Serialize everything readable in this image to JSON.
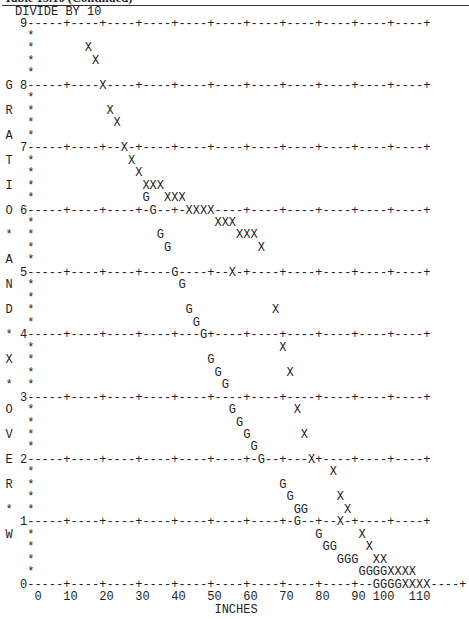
{
  "caption": "Table 15.10 (Continued)",
  "header": "DIVIDE BY 10",
  "chart_data": {
    "type": "scatter",
    "title": "DIVIDE BY 10",
    "xlabel": "INCHES",
    "ylabel": "GRATIO * AND * X * OVER * W",
    "x_ticks": [
      0,
      10,
      20,
      30,
      40,
      50,
      60,
      70,
      80,
      90,
      100,
      110
    ],
    "y_ticks": [
      0,
      1,
      2,
      3,
      4,
      5,
      6,
      7,
      8,
      9
    ],
    "xlim": [
      0,
      120
    ],
    "ylim": [
      0,
      9
    ],
    "grid": true,
    "legend": [
      "G",
      "X"
    ],
    "series": [
      {
        "name": "G",
        "points": [
          [
            34,
            5.6
          ],
          [
            36,
            5.8
          ],
          [
            38,
            6.0
          ],
          [
            36,
            5.4
          ],
          [
            38,
            5.2
          ],
          [
            40,
            5.0
          ],
          [
            42,
            4.8
          ],
          [
            44,
            4.6
          ],
          [
            46,
            4.4
          ],
          [
            48,
            4.0
          ],
          [
            50,
            3.8
          ],
          [
            52,
            3.6
          ],
          [
            54,
            3.4
          ],
          [
            56,
            3.2
          ],
          [
            58,
            2.8
          ],
          [
            60,
            2.6
          ],
          [
            62,
            2.4
          ],
          [
            64,
            2.2
          ],
          [
            64,
            2.0
          ],
          [
            66,
            1.8
          ],
          [
            68,
            1.6
          ],
          [
            70,
            1.4
          ],
          [
            72,
            1.2
          ],
          [
            74,
            1.0
          ],
          [
            76,
            0.8
          ],
          [
            78,
            0.6
          ],
          [
            80,
            0.6
          ],
          [
            82,
            0.4
          ],
          [
            84,
            0.4
          ],
          [
            86,
            0.4
          ],
          [
            88,
            0.2
          ],
          [
            90,
            0.2
          ],
          [
            92,
            0.2
          ],
          [
            94,
            0.2
          ],
          [
            96,
            0.0
          ],
          [
            98,
            0.0
          ],
          [
            100,
            0.0
          ],
          [
            102,
            0.0
          ]
        ]
      },
      {
        "name": "X",
        "points": [
          [
            16,
            8.6
          ],
          [
            18,
            8.4
          ],
          [
            20,
            8.0
          ],
          [
            22,
            7.6
          ],
          [
            24,
            7.4
          ],
          [
            26,
            7.0
          ],
          [
            28,
            6.8
          ],
          [
            30,
            6.6
          ],
          [
            32,
            6.4
          ],
          [
            34,
            6.4
          ],
          [
            36,
            6.4
          ],
          [
            38,
            6.2
          ],
          [
            40,
            6.2
          ],
          [
            42,
            6.2
          ],
          [
            44,
            6.0
          ],
          [
            46,
            6.0
          ],
          [
            48,
            6.0
          ],
          [
            50,
            6.0
          ],
          [
            52,
            5.8
          ],
          [
            54,
            5.8
          ],
          [
            56,
            5.8
          ],
          [
            58,
            5.6
          ],
          [
            60,
            5.6
          ],
          [
            62,
            5.6
          ],
          [
            64,
            5.4
          ],
          [
            66,
            5.0
          ],
          [
            68,
            4.6
          ],
          [
            70,
            4.2
          ],
          [
            72,
            3.6
          ],
          [
            74,
            3.2
          ],
          [
            76,
            2.8
          ],
          [
            78,
            2.4
          ],
          [
            80,
            2.0
          ],
          [
            82,
            1.8
          ],
          [
            84,
            1.4
          ],
          [
            86,
            1.2
          ],
          [
            86,
            1.0
          ],
          [
            88,
            0.8
          ],
          [
            90,
            0.6
          ],
          [
            92,
            0.4
          ],
          [
            94,
            0.4
          ],
          [
            96,
            0.2
          ],
          [
            98,
            0.2
          ],
          [
            100,
            0.2
          ],
          [
            102,
            0.2
          ],
          [
            104,
            0.0
          ],
          [
            106,
            0.0
          ],
          [
            108,
            0.0
          ],
          [
            110,
            0.0
          ]
        ]
      }
    ]
  },
  "plot": {
    "lines": [
      "  9-----+----+----+----+----+----+----+----+----+----+----+",
      "   *",
      "   *       X",
      "   *        X",
      "   *",
      "G 8-----+----X----+----+----+----+----+----+----+----+----+",
      "   *",
      "R  *          X",
      "   *           X",
      "A  *",
      "  7-----+----+--X-+----+----+----+----+----+----+----+----+",
      "T  *             X",
      "   *              X",
      "I  *               XXX",
      "   *               G  XXX",
      "O 6-----+----+----+-G--+-XXXX----+----+----+----+----+----+",
      "   *                         XXX",
      "*  *                 G          XXX",
      "   *                  G            X",
      "A  *",
      "  5-----+----+----+----G----+--X-+----+----+----+----+----+",
      "N  *                    G",
      "   *",
      "D  *                     G           X",
      "   *                      G",
      "* 4-----+----+----+----+---G+----+----+----+----+----+----+",
      "   *                                  X",
      "X  *                        G",
      "   *                         G         X",
      "*  *                          G",
      "  3-----+----+----+----+----+----+----+----+----+----+----+",
      "O  *                           G        X",
      "   *                            G",
      "V  *                             G       X",
      "   *                              G",
      "E 2-----+----+----+----+----+----+-G--+---X+----+----+----+",
      "   *                                         X",
      "R  *                                  G",
      "   *                                   G      X",
      "*  *                                    GG     X",
      "  1-----+----+----+----+----+----+----+-G--+--X-+----+----+",
      "W  *                                       G     X",
      "   *                                        GG    X",
      "   *                                          GGG  XX",
      "   *                                             GGGGXXXX",
      "  0-----+----+----+----+----+----+----+----+----+--GGGGXXXX----+"
    ]
  },
  "x_axis": {
    "labels": "    0   10   20   30   40   50   60   70   80   90 100  110",
    "title": "                             INCHES"
  }
}
